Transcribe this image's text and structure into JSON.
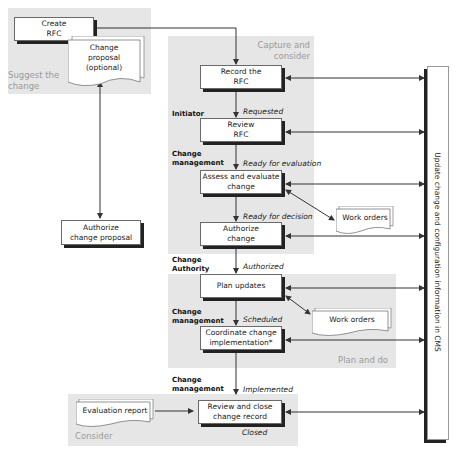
{
  "zones": {
    "suggest": {
      "label": "Suggest the\nchange"
    },
    "capture": {
      "label": "Capture and\nconsider"
    },
    "plan": {
      "label": "Plan and do"
    },
    "consider": {
      "label": "Consider"
    }
  },
  "boxes": {
    "create_rfc": "Create\nRFC",
    "authorize_proposal": "Authorize\nchange proposal",
    "record_rfc": "Record the\nRFC",
    "review_rfc": "Review\nRFC",
    "assess": "Assess and evaluate\nchange",
    "authorize_change": "Authorize\nchange",
    "plan_updates": "Plan updates",
    "coordinate": "Coordinate change\nimplementation*",
    "review_close": "Review and close\nchange record"
  },
  "documents": {
    "change_proposal": "Change\nproposal\n(optional)",
    "work_orders_1": "Work orders",
    "work_orders_2": "Work orders",
    "evaluation_report": "Evaluation report"
  },
  "roles": {
    "initiator": "Initiator",
    "change_mgmt_1": "Change\nmanagement",
    "change_authority": "Change\nAuthority",
    "change_mgmt_2": "Change\nmanagement",
    "change_mgmt_3": "Change\nmanagement"
  },
  "states": {
    "requested": "Requested",
    "ready_eval": "Ready for evaluation",
    "ready_decision": "Ready for decision",
    "authorized": "Authorized",
    "scheduled": "Scheduled",
    "implemented": "Implemented",
    "closed": "Closed"
  },
  "cms": {
    "label": "Update change and configuration information in CMS"
  }
}
